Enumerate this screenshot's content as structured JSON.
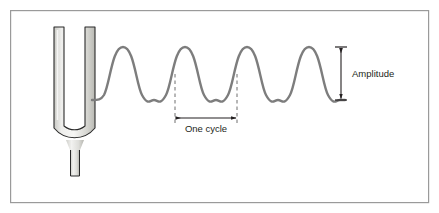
{
  "figure": {
    "background_color": "#ffffff",
    "frame": {
      "name": "figure-border",
      "x": 10,
      "y": 10,
      "width": 419,
      "height": 193,
      "stroke_color": "#9a9a9a",
      "stroke_width": 1.2
    },
    "tuning_fork": {
      "name": "tuning-fork",
      "fill_light": "#f4f4f2",
      "fill_mid": "#d7d7d2",
      "fill_dark": "#b8b8b2",
      "outline_color": "#2a2a2a",
      "outline_width": 1.1,
      "left_tine_x": 54,
      "right_tine_x": 85,
      "tine_width": 10,
      "top_y": 27,
      "bend_y": 128,
      "stem_bottom_y": 176,
      "stem_width": 9
    },
    "wave": {
      "name": "sound-wave",
      "stroke_color": "#7d7d7d",
      "stroke_width": 2.4,
      "start_x": 92,
      "end_x": 345,
      "peak_y": 47,
      "trough_y": 100,
      "baseline_y": 73.5,
      "cycles": 4,
      "cycle_length_px": 62
    },
    "annotations": [
      {
        "name": "one-cycle-annotation",
        "label": "One cycle",
        "label_x": 206,
        "label_y": 132,
        "arrow_y": 118,
        "left_x": 175,
        "right_x": 237,
        "guide_top_y": 74,
        "guide_style": "dashed",
        "color": "#231f20"
      },
      {
        "name": "amplitude-annotation",
        "label": "Amplitude",
        "label_x": 350,
        "label_y": 77,
        "arrow_x": 341,
        "top_y": 47,
        "bottom_y": 100,
        "cap_half_width": 6,
        "color": "#231f20"
      }
    ]
  }
}
